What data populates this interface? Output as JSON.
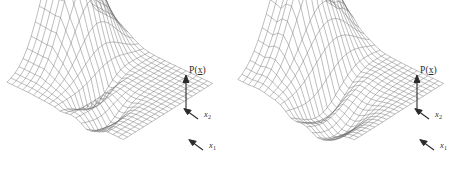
{
  "figure": {
    "background_color": "#ffffff",
    "mesh_color": "#6e6e6e",
    "label_color": "#2b2b2b",
    "panels": [
      {
        "id": "left-surface-plot",
        "name": "left-probability-density-surface",
        "labels": {
          "vertical_axis": "P(x)",
          "vertical_axis_vector": "x",
          "vertical_axis_prefix": "P(",
          "vertical_axis_suffix": ")",
          "axis_x2": "x",
          "axis_x2_sub": "2",
          "axis_x1": "x",
          "axis_x1_sub": "1"
        }
      },
      {
        "id": "right-surface-plot",
        "name": "right-probability-density-surface",
        "labels": {
          "vertical_axis": "P(x)",
          "vertical_axis_vector": "x",
          "vertical_axis_prefix": "P(",
          "vertical_axis_suffix": ")",
          "axis_x2": "x",
          "axis_x2_sub": "2",
          "axis_x1": "x",
          "axis_x1_sub": "1"
        }
      }
    ]
  },
  "chart_data": {
    "type": "surface-mesh-pair",
    "title": "",
    "xlabel": "x1",
    "ylabel": "x2",
    "zlabel": "P(x)",
    "grid": true,
    "legend": false,
    "projection": "parallel-oblique",
    "grid_u_cells": 22,
    "grid_v_cells": 22,
    "surfaces": [
      {
        "name": "left-surface",
        "ridge_amplitude": 1.0,
        "ridge_sharpness": "steep",
        "trough_amplitude": -0.22,
        "trough_sharpness": "narrow",
        "base_level": 0.0,
        "x_range": [
          -3,
          3
        ],
        "y_range": [
          -3,
          3
        ],
        "z_range": [
          -0.3,
          1.0
        ]
      },
      {
        "name": "right-surface",
        "ridge_amplitude": 1.0,
        "ridge_sharpness": "broad",
        "trough_amplitude": -0.3,
        "trough_sharpness": "broad",
        "base_level": 0.0,
        "x_range": [
          -3,
          3
        ],
        "y_range": [
          -3,
          3
        ],
        "z_range": [
          -0.35,
          1.0
        ]
      }
    ],
    "axis_arrows": [
      {
        "name": "P(x)",
        "direction": "up"
      },
      {
        "name": "x2",
        "direction": "up-left"
      },
      {
        "name": "x1",
        "direction": "up-left"
      }
    ]
  }
}
